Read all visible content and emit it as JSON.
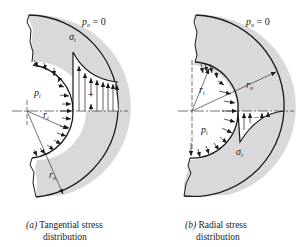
{
  "figures": [
    {
      "id": "a",
      "outer_pressure": {
        "symbol": "p",
        "sub": "o",
        "rhs": " = 0"
      },
      "inner_pressure": {
        "symbol": "p",
        "sub": "i"
      },
      "stress_label": {
        "symbol": "σ",
        "sub": "t"
      },
      "sign": "+",
      "inner_radius": {
        "symbol": "r",
        "sub": "i"
      },
      "outer_radius": {
        "symbol": "r",
        "sub": "o"
      },
      "caption_tag": "(a)",
      "caption_line1": " Tangential stress",
      "caption_line2": "distribution"
    },
    {
      "id": "b",
      "outer_pressure": {
        "symbol": "p",
        "sub": "o",
        "rhs": " = 0"
      },
      "inner_pressure": {
        "symbol": "p",
        "sub": "i"
      },
      "stress_label": {
        "symbol": "σ",
        "sub": "r"
      },
      "sign": "−",
      "inner_radius": {
        "symbol": "r",
        "sub": "i"
      },
      "outer_radius": {
        "symbol": "r",
        "sub": "o"
      },
      "caption_tag": "(b)",
      "caption_line1": " Radial stress",
      "caption_line2": "distribution"
    }
  ],
  "colors": {
    "fill": "#d9d9d9",
    "stroke": "#1a1a1a"
  }
}
